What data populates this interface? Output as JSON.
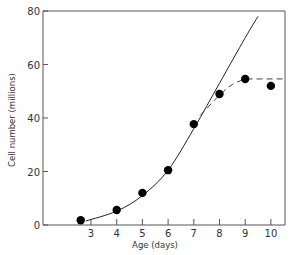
{
  "chart_data": {
    "type": "line",
    "title": "",
    "xlabel": "Age (days)",
    "ylabel": "Cell number (millions)",
    "xlim": [
      1.8,
      10.5
    ],
    "ylim": [
      0,
      80
    ],
    "x_ticks": [
      3,
      4,
      5,
      6,
      7,
      8,
      9,
      10
    ],
    "y_ticks": [
      0,
      20,
      40,
      60,
      80
    ],
    "grid": false,
    "legend": null,
    "series": [
      {
        "name": "observed",
        "style": "markers",
        "x": [
          2.6,
          4,
          5,
          6,
          7,
          8,
          9,
          10
        ],
        "y": [
          1.8,
          5.6,
          12,
          20.5,
          37.7,
          49,
          54.6,
          52
        ]
      },
      {
        "name": "exponential fit",
        "style": "solid-line",
        "x": [
          2.8,
          4,
          5,
          6,
          7,
          8,
          9,
          9.5
        ],
        "y": [
          1.5,
          5.2,
          11,
          20.5,
          36,
          53,
          70,
          78
        ]
      },
      {
        "name": "plateau fit",
        "style": "dashed-line",
        "x": [
          7.25,
          8,
          8.5,
          9,
          10.5
        ],
        "y": [
          41,
          48.5,
          52.5,
          54.6,
          54.6
        ]
      }
    ]
  },
  "labels": {
    "xlabel": "Age (days)",
    "ylabel": "Cell number (millions)",
    "x_ticks": [
      "3",
      "4",
      "5",
      "6",
      "7",
      "8",
      "9",
      "10"
    ],
    "y_ticks": [
      "0",
      "20",
      "40",
      "60",
      "80"
    ]
  }
}
